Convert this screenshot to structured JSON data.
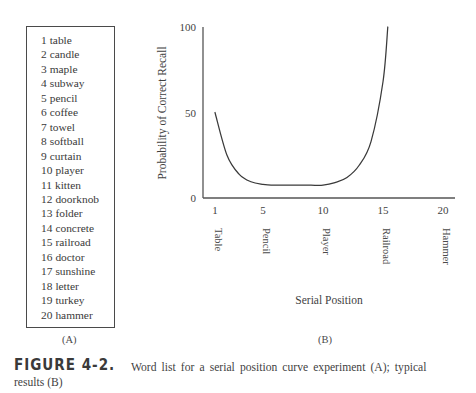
{
  "figure": {
    "number_label": "FIGURE 4-2.",
    "caption_main": "Word list for a serial position curve experiment (A); typical",
    "caption_tail": "results (B)",
    "panel_a_label": "(A)",
    "panel_b_label": "(B)"
  },
  "word_list": {
    "items": [
      {
        "index": "1",
        "word": "table"
      },
      {
        "index": "2",
        "word": "candle"
      },
      {
        "index": "3",
        "word": "maple"
      },
      {
        "index": "4",
        "word": "subway"
      },
      {
        "index": "5",
        "word": "pencil"
      },
      {
        "index": "6",
        "word": "coffee"
      },
      {
        "index": "7",
        "word": "towel"
      },
      {
        "index": "8",
        "word": "softball"
      },
      {
        "index": "9",
        "word": "curtain"
      },
      {
        "index": "10",
        "word": "player"
      },
      {
        "index": "11",
        "word": "kitten"
      },
      {
        "index": "12",
        "word": "doorknob"
      },
      {
        "index": "13",
        "word": "folder"
      },
      {
        "index": "14",
        "word": "concrete"
      },
      {
        "index": "15",
        "word": "railroad"
      },
      {
        "index": "16",
        "word": "doctor"
      },
      {
        "index": "17",
        "word": "sunshine"
      },
      {
        "index": "18",
        "word": "letter"
      },
      {
        "index": "19",
        "word": "turkey"
      },
      {
        "index": "20",
        "word": "hammer"
      }
    ]
  },
  "chart_data": {
    "type": "line",
    "title": "",
    "xlabel": "Serial Position",
    "ylabel": "Probability of Correct Recall",
    "xlim": [
      0,
      21
    ],
    "ylim": [
      0,
      100
    ],
    "grid": false,
    "legend": null,
    "line_color": "#3a3a3a",
    "axis_color": "#555555",
    "xticks": [
      1,
      5,
      10,
      15,
      20
    ],
    "xtick_labels": [
      "1",
      "5",
      "10",
      "15",
      "20"
    ],
    "xtick_word_labels": [
      "Table",
      "Pencil",
      "Player",
      "Railroad",
      "Hammer"
    ],
    "yticks": [
      0,
      50,
      100
    ],
    "ytick_labels": [
      "0",
      "50",
      "100"
    ],
    "x": [
      1,
      2,
      3,
      4,
      5,
      6,
      7,
      8,
      9,
      10,
      11,
      12,
      13,
      14,
      15,
      15.4
    ],
    "values": [
      50,
      25,
      14,
      9.5,
      8,
      7.5,
      7.5,
      7.5,
      7.5,
      7.5,
      9,
      12,
      19,
      33,
      68,
      100
    ]
  }
}
